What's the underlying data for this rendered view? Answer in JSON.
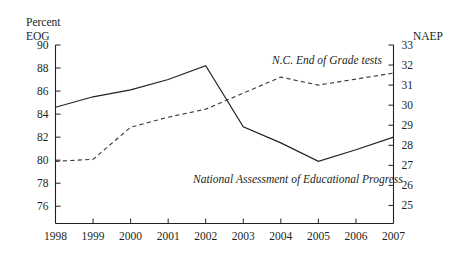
{
  "chart_data": {
    "type": "line",
    "title": "",
    "subtitle": "",
    "xlabel": "",
    "grid": false,
    "legend_position": "inline-annotation",
    "x": [
      1998,
      1999,
      2000,
      2001,
      2002,
      2003,
      2004,
      2005,
      2006,
      2007
    ],
    "x_tick_labels": [
      "1998",
      "1999",
      "2000",
      "2001",
      "2002",
      "2003",
      "2004",
      "2005",
      "2006",
      "2007"
    ],
    "axes": {
      "left": {
        "title_line1": "Percent",
        "title_line2": "EOG",
        "ylabel": "Percent EOG",
        "ylim": [
          74.5,
          90
        ],
        "ticks": [
          76,
          78,
          80,
          82,
          84,
          86,
          88,
          90
        ],
        "tick_labels": [
          "76",
          "78",
          "80",
          "82",
          "84",
          "86",
          "88",
          "90"
        ]
      },
      "right": {
        "title": "NAEP",
        "ylabel": "NAEP",
        "ylim": [
          24.1,
          33
        ],
        "ticks": [
          25,
          26,
          27,
          28,
          29,
          30,
          31,
          32,
          33
        ],
        "tick_labels": [
          "25",
          "26",
          "27",
          "28",
          "29",
          "30",
          "31",
          "32",
          "33"
        ]
      }
    },
    "series": [
      {
        "name": "N.C. End of Grade tests",
        "axis": "left",
        "style": "solid",
        "color": "#231f20",
        "annotation": "N.C. End of Grade tests",
        "values": [
          84.6,
          85.5,
          86.1,
          87.0,
          88.2,
          82.9,
          81.5,
          79.9,
          80.9,
          82.0
        ]
      },
      {
        "name": "National Assessment of Educational Progress",
        "axis": "right",
        "style": "dashed",
        "color": "#3a3a3a",
        "annotation": "National Assessment of Educational Progress",
        "values": [
          27.2,
          27.3,
          28.9,
          29.4,
          29.8,
          30.6,
          31.4,
          31.0,
          31.3,
          31.6
        ]
      }
    ]
  },
  "annotations": {
    "series_upper": "N.C. End of Grade tests",
    "series_lower": "National Assessment of Educational Progress"
  },
  "axis_titles": {
    "left_line1": "Percent",
    "left_line2": "EOG",
    "right": "NAEP"
  },
  "y_left_labels": [
    "90",
    "88",
    "86",
    "84",
    "82",
    "80",
    "78",
    "76"
  ],
  "y_right_labels": [
    "33",
    "32",
    "31",
    "30",
    "29",
    "28",
    "27",
    "26",
    "25"
  ],
  "x_labels": [
    "1998",
    "1999",
    "2000",
    "2001",
    "2002",
    "2003",
    "2004",
    "2005",
    "2006",
    "2007"
  ]
}
